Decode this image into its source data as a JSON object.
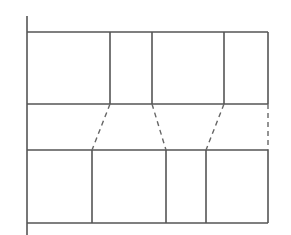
{
  "diagram": {
    "type": "rectangular-partition",
    "line_color": "#555555",
    "background": "#ffffff",
    "axis": {
      "x": 27,
      "y1": 16,
      "y2": 235
    },
    "right_edge_x": 268,
    "top_row": {
      "y_top": 32,
      "y_bottom": 104,
      "dividers_x": [
        110,
        152,
        224
      ],
      "cell_count": 4
    },
    "bottom_row": {
      "y_top": 150,
      "y_bottom": 223,
      "dividers_x": [
        92,
        166,
        206
      ],
      "cell_count": 4
    },
    "connectors": [
      {
        "from": [
          110,
          104
        ],
        "to": [
          92,
          150
        ],
        "style": "dashed"
      },
      {
        "from": [
          152,
          104
        ],
        "to": [
          166,
          150
        ],
        "style": "dashed"
      },
      {
        "from": [
          224,
          104
        ],
        "to": [
          206,
          150
        ],
        "style": "dashed"
      },
      {
        "from": [
          268,
          104
        ],
        "to": [
          268,
          150
        ],
        "style": "dashed"
      }
    ]
  }
}
